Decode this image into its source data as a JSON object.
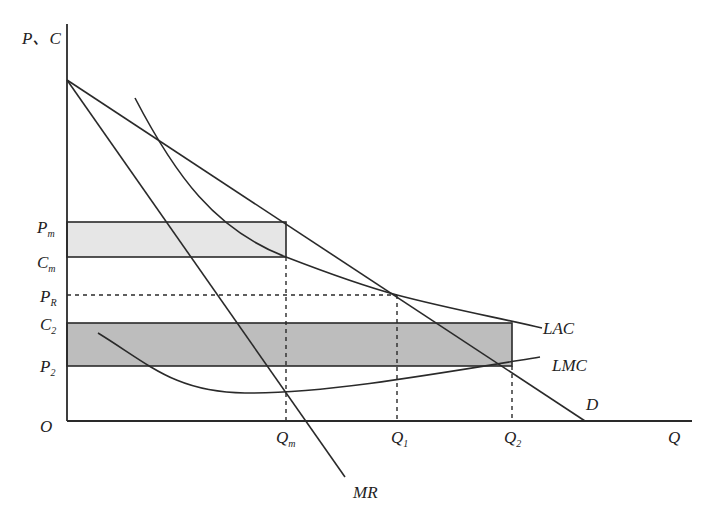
{
  "diagram": {
    "type": "economics-monopoly-regulation",
    "axes": {
      "y_label": "P、C",
      "x_label": "Q",
      "origin_label": "O"
    },
    "y_ticks": [
      {
        "base": "P",
        "sub": "m"
      },
      {
        "base": "C",
        "sub": "m"
      },
      {
        "base": "P",
        "sub": "R"
      },
      {
        "base": "C",
        "sub": "2"
      },
      {
        "base": "P",
        "sub": "2"
      }
    ],
    "x_ticks": [
      {
        "base": "Q",
        "sub": "m"
      },
      {
        "base": "Q",
        "sub": "1"
      },
      {
        "base": "Q",
        "sub": "2"
      }
    ],
    "curves": {
      "demand": "D",
      "marginal_revenue": "MR",
      "long_run_average_cost": "LAC",
      "long_run_marginal_cost": "LMC"
    },
    "colors": {
      "line": "#2a2a2a",
      "light_rect": "#e6e6e6",
      "dark_rect": "#bdbdbd",
      "background": "#ffffff"
    }
  }
}
